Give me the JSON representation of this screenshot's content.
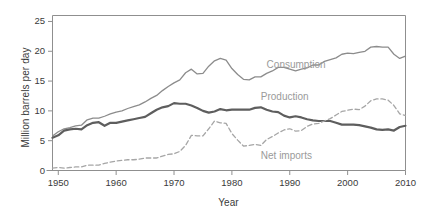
{
  "chart_data": {
    "type": "line",
    "title": "",
    "xlabel": "Year",
    "ylabel": "Million barrels per day",
    "xlim": [
      1949,
      2010
    ],
    "ylim": [
      0,
      26
    ],
    "xticks": [
      1950,
      1960,
      1970,
      1980,
      1990,
      2000,
      2010
    ],
    "yticks": [
      0,
      5,
      10,
      15,
      20,
      25
    ],
    "grid": false,
    "legend_position": "inline-annotations",
    "x": [
      1949,
      1950,
      1951,
      1952,
      1953,
      1954,
      1955,
      1956,
      1957,
      1958,
      1959,
      1960,
      1961,
      1962,
      1963,
      1964,
      1965,
      1966,
      1967,
      1968,
      1969,
      1970,
      1971,
      1972,
      1973,
      1974,
      1975,
      1976,
      1977,
      1978,
      1979,
      1980,
      1981,
      1982,
      1983,
      1984,
      1985,
      1986,
      1987,
      1988,
      1989,
      1990,
      1991,
      1992,
      1993,
      1994,
      1995,
      1996,
      1997,
      1998,
      1999,
      2000,
      2001,
      2002,
      2003,
      2004,
      2005,
      2006,
      2007,
      2008,
      2009,
      2010
    ],
    "series": [
      {
        "name": "Consumption",
        "style": "solid",
        "color": "#8c8c8c",
        "width": 1.3,
        "label_x": 1986,
        "label_y": 17.6,
        "values": [
          5.8,
          6.5,
          7.0,
          7.2,
          7.5,
          7.6,
          8.5,
          8.8,
          8.8,
          9.1,
          9.5,
          9.8,
          10.0,
          10.4,
          10.7,
          11.0,
          11.5,
          12.1,
          12.6,
          13.4,
          14.1,
          14.7,
          15.2,
          16.4,
          17.0,
          16.2,
          16.3,
          17.5,
          18.4,
          18.8,
          18.5,
          17.1,
          16.1,
          15.3,
          15.2,
          15.7,
          15.7,
          16.3,
          16.7,
          17.3,
          17.3,
          17.0,
          16.7,
          17.0,
          17.2,
          17.7,
          17.7,
          18.3,
          18.6,
          18.9,
          19.5,
          19.7,
          19.6,
          19.8,
          20.0,
          20.7,
          20.8,
          20.7,
          20.7,
          19.5,
          18.8,
          19.2
        ]
      },
      {
        "name": "Production",
        "style": "solid",
        "color": "#5e5e5e",
        "width": 2.2,
        "label_x": 1985,
        "label_y": 12.2,
        "values": [
          5.5,
          5.9,
          6.7,
          6.9,
          7.0,
          6.9,
          7.6,
          8.0,
          8.1,
          7.5,
          8.0,
          8.0,
          8.2,
          8.4,
          8.6,
          8.8,
          9.0,
          9.6,
          10.2,
          10.6,
          10.8,
          11.3,
          11.2,
          11.2,
          10.9,
          10.5,
          10.0,
          9.7,
          9.9,
          10.3,
          10.1,
          10.2,
          10.2,
          10.2,
          10.2,
          10.5,
          10.6,
          10.2,
          9.9,
          9.8,
          9.2,
          8.9,
          9.1,
          8.9,
          8.6,
          8.4,
          8.3,
          8.3,
          8.3,
          8.0,
          7.7,
          7.7,
          7.7,
          7.6,
          7.4,
          7.2,
          6.9,
          6.8,
          6.9,
          6.7,
          7.3,
          7.5
        ]
      },
      {
        "name": "Net imports",
        "style": "dashed",
        "color": "#a6a6a6",
        "width": 1.3,
        "label_x": 1985,
        "label_y": 2.2,
        "values": [
          0.4,
          0.5,
          0.4,
          0.5,
          0.6,
          0.6,
          0.9,
          0.9,
          0.9,
          1.2,
          1.4,
          1.6,
          1.7,
          1.8,
          1.8,
          1.9,
          2.1,
          2.1,
          2.1,
          2.4,
          2.7,
          2.8,
          3.2,
          4.2,
          5.9,
          5.8,
          5.8,
          7.0,
          8.3,
          8.0,
          7.9,
          6.2,
          5.1,
          4.1,
          4.2,
          4.4,
          4.2,
          5.2,
          5.7,
          6.3,
          6.8,
          7.0,
          6.6,
          6.7,
          7.4,
          7.8,
          7.9,
          8.3,
          8.7,
          9.3,
          9.9,
          10.1,
          10.3,
          10.2,
          10.8,
          11.7,
          12.0,
          12.0,
          11.8,
          10.9,
          9.5,
          9.2
        ]
      }
    ]
  },
  "labels": {
    "ylabel": "Million barrels per day",
    "xlabel": "Year",
    "consumption": "Consumption",
    "production": "Production",
    "net_imports": "Net imports",
    "ytick_0": "0",
    "ytick_5": "5",
    "ytick_10": "10",
    "ytick_15": "15",
    "ytick_20": "20",
    "ytick_25": "25",
    "xtick_1950": "1950",
    "xtick_1960": "1960",
    "xtick_1970": "1970",
    "xtick_1980": "1980",
    "xtick_1990": "1990",
    "xtick_2000": "2000",
    "xtick_2010": "2010"
  },
  "colors": {
    "axis": "#8f8f8f",
    "text": "#3a3a3a",
    "annotation": "#9a9a9a",
    "consumption": "#8c8c8c",
    "production": "#5e5e5e",
    "net_imports": "#a6a6a6",
    "background": "#ffffff"
  }
}
